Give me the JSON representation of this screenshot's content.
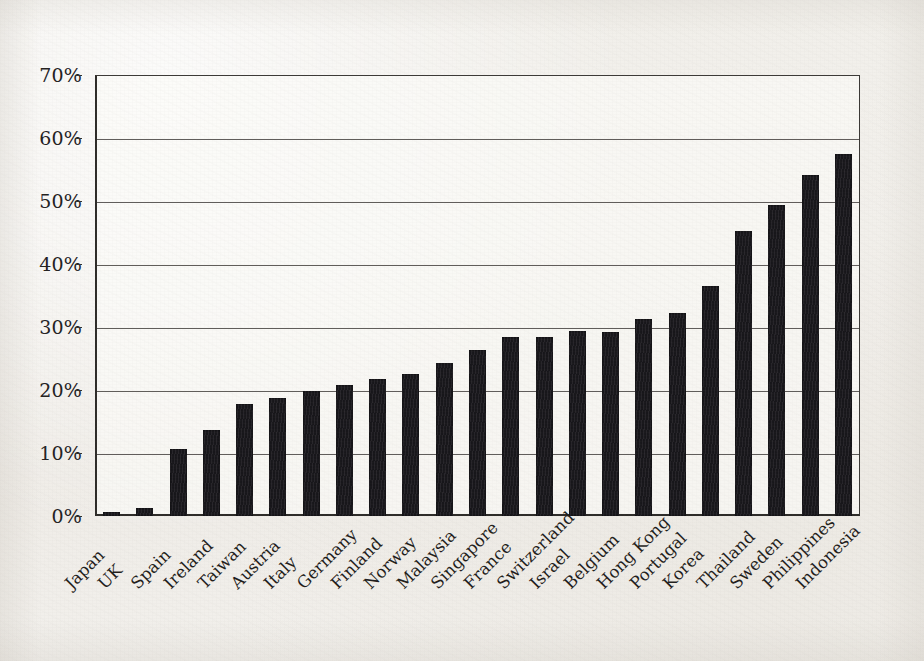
{
  "document": {
    "kind": "scanned-page-figure",
    "background_color": "#f1efea",
    "ink_color": "#1a181c"
  },
  "chart_data": {
    "type": "bar",
    "title": "",
    "subtitle": "",
    "xlabel": "",
    "ylabel": "",
    "ylim": [
      0,
      70
    ],
    "y_unit": "%",
    "grid": true,
    "legend": null,
    "orientation": "vertical",
    "sorted": "ascending",
    "y_ticks": [
      0,
      10,
      20,
      30,
      40,
      50,
      60,
      70
    ],
    "y_tick_labels": [
      "0%",
      "10%",
      "20%",
      "30%",
      "40%",
      "50%",
      "60%",
      "70%"
    ],
    "categories": [
      "Japan",
      "UK",
      "Spain",
      "Ireland",
      "Taiwan",
      "Austria",
      "Italy",
      "Germany",
      "Finland",
      "Norway",
      "Malaysia",
      "Singapore",
      "France",
      "Switzerland",
      "Israel",
      "Belgium",
      "Hong Kong",
      "Portugal",
      "Korea",
      "Thailand",
      "Sweden",
      "Philippines",
      "Indonesia"
    ],
    "values": [
      0.6,
      1.2,
      10.7,
      13.7,
      17.8,
      18.8,
      19.9,
      20.8,
      21.7,
      22.6,
      24.3,
      26.3,
      28.4,
      28.4,
      29.4,
      29.2,
      31.2,
      32.3,
      36.5,
      45.3,
      49.4,
      54.2,
      57.4
    ],
    "value_labels": [
      "0.6%",
      "1.2%",
      "10.7%",
      "13.7%",
      "17.8%",
      "18.8%",
      "19.9%",
      "20.8%",
      "21.7%",
      "22.6%",
      "24.3%",
      "26.3%",
      "28.4%",
      "28.4%",
      "29.4%",
      "29.2%",
      "31.2%",
      "32.3%",
      "36.5%",
      "45.3%",
      "49.4%",
      "54.2%",
      "57.4%"
    ],
    "bar_color": "#1a181c",
    "data_labels_shown": false
  }
}
